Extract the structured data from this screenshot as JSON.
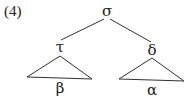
{
  "example_number": "(4)",
  "tree": {
    "root": {
      "label": "σ",
      "x": 107,
      "y": 16
    },
    "left_child": {
      "label": "τ",
      "x": 60,
      "y": 52,
      "subtree_label": "β",
      "subtree_label_y": 93
    },
    "right_child": {
      "label": "δ",
      "x": 152,
      "y": 55,
      "subtree_label": "α",
      "subtree_label_y": 95
    }
  },
  "colors": {
    "ink": "#333333",
    "background": "#ffffff"
  }
}
